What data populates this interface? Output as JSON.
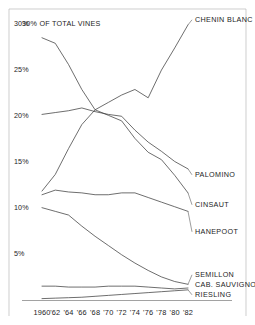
{
  "chart_data": {
    "type": "line",
    "title": "30% OF TOTAL VINES",
    "subtitle": "",
    "xlabel": "",
    "ylabel": "",
    "xlim": [
      1960,
      1982
    ],
    "ylim": [
      0,
      30
    ],
    "grid": false,
    "legend_position": "right-inline-labels",
    "x": [
      1960,
      1962,
      1964,
      1966,
      1968,
      1970,
      1972,
      1974,
      1976,
      1978,
      1980,
      1982
    ],
    "tick_labels_x": [
      "1960",
      "'62",
      "'64",
      "'66",
      "'68",
      "'70",
      "'72",
      "'74",
      "'76",
      "'78",
      "'80",
      "'82"
    ],
    "tick_labels_y": [
      "30%",
      "25%",
      "20%",
      "15%",
      "10%",
      "5%"
    ],
    "tick_values_y": [
      30,
      25,
      20,
      15,
      10,
      5
    ],
    "series": [
      {
        "name": "CHENIN BLANC",
        "values": [
          11.8,
          13.6,
          16.4,
          19.0,
          20.6,
          21.4,
          22.2,
          22.8,
          21.9,
          24.9,
          27.3,
          29.8
        ]
      },
      {
        "name": "PALOMINO",
        "values": [
          20.1,
          20.3,
          20.5,
          20.8,
          20.4,
          20.1,
          19.9,
          18.4,
          17.1,
          16.1,
          15.0,
          14.2
        ]
      },
      {
        "name": "CINSAUT",
        "values": [
          28.4,
          27.8,
          25.5,
          22.8,
          20.6,
          20.0,
          19.4,
          17.5,
          16.0,
          15.2,
          13.5,
          11.6
        ]
      },
      {
        "name": "HANEPOOT",
        "values": [
          11.4,
          11.9,
          11.7,
          11.6,
          11.4,
          11.4,
          11.6,
          11.6,
          11.1,
          10.6,
          10.1,
          9.6
        ]
      },
      {
        "name": "SEMILLON",
        "values": [
          10.0,
          9.6,
          9.2,
          8.0,
          6.9,
          5.9,
          4.9,
          4.0,
          3.2,
          2.5,
          2.0,
          1.7
        ]
      },
      {
        "name": "CAB. SAUVIGNON",
        "values": [
          1.5,
          1.5,
          1.4,
          1.4,
          1.4,
          1.5,
          1.5,
          1.5,
          1.4,
          1.3,
          1.2,
          1.3
        ]
      },
      {
        "name": "RIESLING",
        "values": [
          0.15,
          0.2,
          0.25,
          0.3,
          0.4,
          0.5,
          0.6,
          0.7,
          0.8,
          0.9,
          1.0,
          1.1
        ]
      }
    ],
    "series_label_positions": [
      {
        "name": "CHENIN BLANC",
        "y_px": 22
      },
      {
        "name": "PALOMINO",
        "y_px": 177
      },
      {
        "name": "CINSAUT",
        "y_px": 207
      },
      {
        "name": "HANEPOOT",
        "y_px": 234
      },
      {
        "name": "SEMILLON",
        "y_px": 277
      },
      {
        "name": "CAB. SAUVIGNON",
        "y_px": 287
      },
      {
        "name": "RIESLING",
        "y_px": 297
      }
    ],
    "colors": {
      "line": "#3d3d3d",
      "axis": "#8a8a8a",
      "text": "#1c1c1c",
      "background": "#ffffff"
    }
  }
}
